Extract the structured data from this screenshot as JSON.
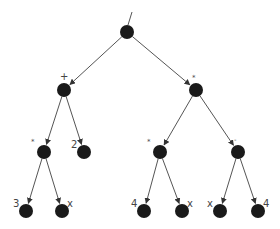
{
  "diagram": {
    "type": "expression-tree",
    "colors": {
      "node": "#1a1a1a",
      "edge": "#555555",
      "label": "#444444"
    },
    "nodes": [
      {
        "id": "n0",
        "label": "/",
        "x": 127,
        "y": 32
      },
      {
        "id": "n1",
        "label": "+",
        "x": 64,
        "y": 90
      },
      {
        "id": "n2",
        "label": "*",
        "x": 196,
        "y": 90
      },
      {
        "id": "n3",
        "label": "*",
        "x": 44,
        "y": 152
      },
      {
        "id": "n4",
        "label": "2",
        "x": 84,
        "y": 152
      },
      {
        "id": "n5",
        "label": "*",
        "x": 160,
        "y": 152
      },
      {
        "id": "n6",
        "label": "-",
        "x": 238,
        "y": 152
      },
      {
        "id": "n7",
        "label": "3",
        "x": 26,
        "y": 211
      },
      {
        "id": "n8",
        "label": "x",
        "x": 62,
        "y": 211
      },
      {
        "id": "n9",
        "label": "4",
        "x": 144,
        "y": 211
      },
      {
        "id": "n10",
        "label": "x",
        "x": 182,
        "y": 211
      },
      {
        "id": "n11",
        "label": "x",
        "x": 220,
        "y": 211
      },
      {
        "id": "n12",
        "label": "4",
        "x": 258,
        "y": 211
      }
    ],
    "edges": [
      [
        "n0",
        "n1"
      ],
      [
        "n0",
        "n2"
      ],
      [
        "n1",
        "n3"
      ],
      [
        "n1",
        "n4"
      ],
      [
        "n2",
        "n5"
      ],
      [
        "n2",
        "n6"
      ],
      [
        "n3",
        "n7"
      ],
      [
        "n3",
        "n8"
      ],
      [
        "n5",
        "n9"
      ],
      [
        "n5",
        "n10"
      ],
      [
        "n6",
        "n11"
      ],
      [
        "n6",
        "n12"
      ]
    ]
  }
}
